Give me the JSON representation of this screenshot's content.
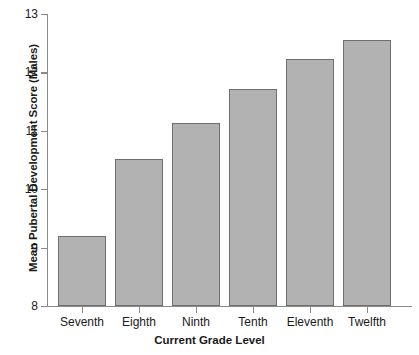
{
  "chart_data": {
    "type": "bar",
    "title": "",
    "xlabel": "Current Grade Level",
    "ylabel": "Mean Pubertal Development Score (Males)",
    "categories": [
      "Seventh",
      "Eighth",
      "Ninth",
      "Tenth",
      "Eleventh",
      "Twelfth"
    ],
    "values": [
      9.2,
      10.52,
      11.13,
      11.72,
      12.23,
      12.55
    ],
    "ylim": [
      8,
      13
    ],
    "yticks": [
      8,
      9,
      10,
      11,
      12,
      13
    ],
    "ytick_labels": [
      "8",
      "9",
      "10",
      "11",
      "12",
      "13"
    ],
    "grid": false,
    "legend": false,
    "bar_color": "#b2b2b2",
    "bar_border_color": "#6f6f6f",
    "axis_color": "#8a8a8a"
  }
}
